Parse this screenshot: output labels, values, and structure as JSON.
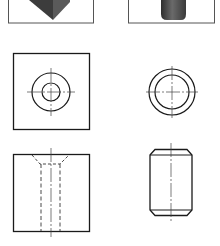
{
  "figure": {
    "type": "orthographic-projection-drawing",
    "colors": {
      "background": "#ffffff",
      "line": "#1a1a1a",
      "center_line": "#444444",
      "solid_dark": "#3a3a3a",
      "solid_light": "#777777",
      "frame": "#555555"
    },
    "panels": [
      {
        "id": "part-a-3d",
        "label": "",
        "description": "shaded 3D view of part A (block, corner visible)"
      },
      {
        "id": "part-b-3d",
        "label": "",
        "description": "shaded 3D view of part B (cylinder)"
      },
      {
        "id": "part-a-top",
        "label": "",
        "description": "top view of square block with concentric circles (through hole with countersink)"
      },
      {
        "id": "part-b-top",
        "label": "",
        "description": "top view of cylinder with two concentric circles (chamfer)"
      },
      {
        "id": "part-a-front",
        "label": "",
        "description": "front view of block with hidden lines for countersunk hole"
      },
      {
        "id": "part-b-front",
        "label": "",
        "description": "front view of cylinder with chamfered ends and center line"
      }
    ]
  }
}
